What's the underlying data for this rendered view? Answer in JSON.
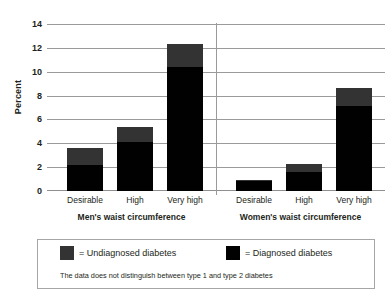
{
  "chart_data": {
    "type": "bar",
    "subtype": "stacked-bar",
    "title": "",
    "xlabel": "",
    "ylabel": "Percent",
    "ylim": [
      0,
      14
    ],
    "ytick_step": 2,
    "yticks": [
      0,
      2,
      4,
      6,
      8,
      10,
      12,
      14
    ],
    "ytick_labels": [
      "0",
      "2",
      "4",
      "6",
      "8",
      "10",
      "12",
      "14"
    ],
    "grid": true,
    "grid_axis": "y",
    "legend_position": "bottom",
    "categories": [
      "Desirable",
      "High",
      "Very high",
      "Desirable",
      "High",
      "Very high"
    ],
    "groups": [
      {
        "label": "Men's waist circumference",
        "categories": [
          "Desirable",
          "High",
          "Very high"
        ]
      },
      {
        "label": "Women's waist circumference",
        "categories": [
          "Desirable",
          "High",
          "Very high"
        ]
      }
    ],
    "series": [
      {
        "name": "Diagnosed diabetes",
        "color": "#010101",
        "values": [
          2.2,
          4.1,
          10.4,
          0.8,
          1.6,
          7.1
        ]
      },
      {
        "name": "Undiagnosed diabetes",
        "color": "#333333",
        "values": [
          1.4,
          1.3,
          1.9,
          0.1,
          0.7,
          1.5
        ]
      }
    ],
    "totals": [
      3.6,
      5.4,
      12.3,
      0.9,
      2.3,
      8.6
    ],
    "annotations": [
      "The data does not distinguish between type 1 and type 2 diabetes"
    ]
  },
  "axes": {
    "y_title": "Percent",
    "y_tick_labels": [
      "14",
      "12",
      "10",
      "8",
      "6",
      "4",
      "2",
      "0"
    ]
  },
  "x_axis": {
    "tick_labels": [
      "Desirable",
      "High",
      "Very high",
      "Desirable",
      "High",
      "Very high"
    ],
    "group_labels": [
      "Men's waist circumference",
      "Women's waist circumference"
    ]
  },
  "legend": {
    "entries": [
      {
        "label": "= Undiagnosed diabetes",
        "color": "#333333",
        "swatch_name": "undiagnosed"
      },
      {
        "label": "= Diagnosed diabetes",
        "color": "#010101",
        "swatch_name": "diagnosed"
      }
    ],
    "note": "The data does not distinguish between type 1 and type 2 diabetes"
  },
  "colors": {
    "diagnosed": "#010101",
    "undiagnosed": "#333333",
    "gridline": "#9a9a9a",
    "text": "#231f20",
    "legend_border": "#a6a6a6",
    "background": "#ffffff"
  }
}
